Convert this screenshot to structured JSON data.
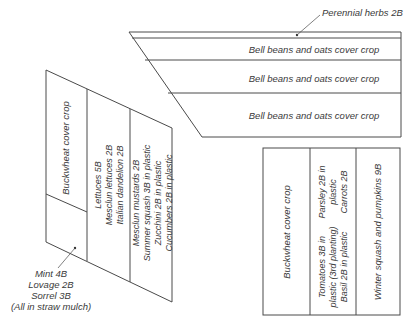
{
  "diagram": {
    "type": "garden-bed-layout",
    "colors": {
      "line": "#4a4a4a",
      "text": "#3a3a3a",
      "background": "#ffffff"
    },
    "top_block": {
      "callout": "Perennial herbs 2B",
      "rows": [
        {
          "label": ""
        },
        {
          "label": "Bell beans and oats cover crop"
        },
        {
          "label": "Bell beans and oats cover crop"
        },
        {
          "label": "Bell beans and oats cover crop"
        }
      ]
    },
    "left_block": {
      "columns": [
        {
          "lines": [
            "Buckwheat cover crop"
          ]
        },
        {
          "lines": [
            "Lettuces 5B",
            "Mesclun lettuces 2B",
            "Italian dandelion 2B"
          ]
        },
        {
          "lines": [
            "Mesclun mustards 2B",
            "Summer squash 3B in plastic",
            "Zucchini 2B in plastic",
            "Cucumbers 2B in plastic"
          ]
        }
      ],
      "callout": [
        "Mint 4B",
        "Lovage 2B",
        "Sorrel 3B",
        "(All in straw mulch)"
      ]
    },
    "right_block": {
      "columns": [
        {
          "lines": [
            "Buckwheat cover crop"
          ]
        },
        {
          "top_lines": [
            "Parsley 2B in",
            "plastic",
            "Carrots 2B"
          ],
          "bottom_lines": [
            "Tomatoes 3B in",
            "plastic (3rd planting)",
            "Basil 2B in plastic"
          ]
        },
        {
          "lines": [
            "Winter squash and pumpkins 9B"
          ]
        }
      ]
    }
  }
}
